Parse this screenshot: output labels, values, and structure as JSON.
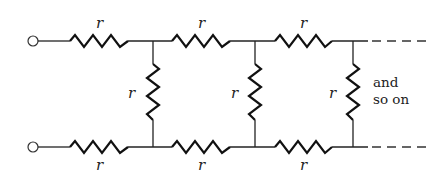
{
  "diagram": {
    "type": "infinite resistor ladder network",
    "resistor_label": "r",
    "top_resistors": [
      {
        "label": "r",
        "x1": 70,
        "x2": 128
      },
      {
        "label": "r",
        "x1": 172,
        "x2": 230
      },
      {
        "label": "r",
        "x1": 275,
        "x2": 332
      }
    ],
    "bottom_resistors": [
      {
        "label": "r",
        "x1": 70,
        "x2": 128
      },
      {
        "label": "r",
        "x1": 172,
        "x2": 230
      },
      {
        "label": "r",
        "x1": 275,
        "x2": 332
      }
    ],
    "shunt_resistors": [
      {
        "label": "r",
        "x": 153
      },
      {
        "label": "r",
        "x": 255
      },
      {
        "label": "r",
        "x": 353
      }
    ],
    "continuation_note_line1": "and",
    "continuation_note_line2": "so on",
    "terminals": 2,
    "colors": {
      "ink": "#222222",
      "background": "#ffffff"
    }
  }
}
